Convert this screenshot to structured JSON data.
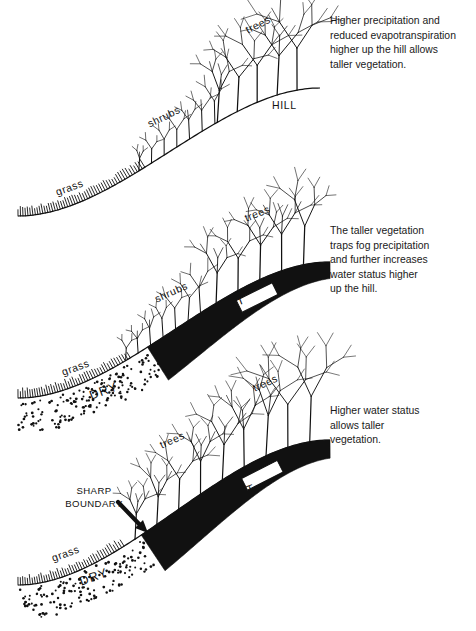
{
  "figure": {
    "background_color": "#ffffff",
    "ink_color": "#111111"
  },
  "panels": [
    {
      "id": "panel-1",
      "caption_lines": [
        "Higher precipitation and",
        "reduced evapotranspiration",
        "higher up the hill allows",
        "taller vegetation."
      ],
      "labels": {
        "grass": "grass",
        "shrubs": "shrubs",
        "trees": "trees",
        "hill": "HILL"
      },
      "has_wet_band": false,
      "has_dry_zone": false
    },
    {
      "id": "panel-2",
      "caption_lines": [
        "The taller vegetation",
        "traps fog precipitation",
        "and further increases",
        "water status higher",
        "up the hill."
      ],
      "labels": {
        "grass": "grass",
        "shrubs": "shrubs",
        "trees": "trees",
        "wet": "WET",
        "dry": "DRY"
      },
      "has_wet_band": true,
      "has_dry_zone": true
    },
    {
      "id": "panel-3",
      "caption_lines": [
        "Higher water status",
        "allows taller",
        "vegetation."
      ],
      "labels": {
        "grass": "grass",
        "trees_lower": "trees",
        "trees_upper": "trees",
        "wet": "WET",
        "dry": "DRY",
        "sharp_boundary_line1": "SHARP",
        "sharp_boundary_line2": "BOUNDARY"
      },
      "has_wet_band": true,
      "has_dry_zone": true,
      "has_sharp_boundary_arrow": true
    }
  ],
  "legend_terms": {
    "wet": "WET",
    "dry": "DRY",
    "hill": "HILL"
  }
}
